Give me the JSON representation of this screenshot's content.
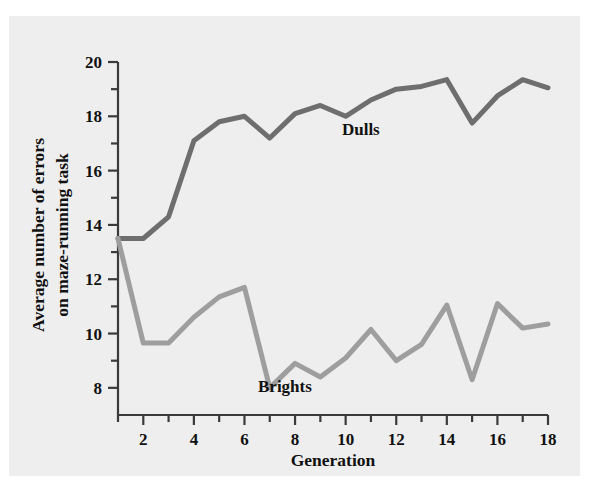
{
  "figure": {
    "background_color": "#eeeeee",
    "page_color": "#ffffff"
  },
  "chart_data": {
    "type": "line",
    "title": "",
    "xlabel": "Generation",
    "ylabel_line1": "Average number of errors",
    "ylabel_line2": "on maze-running task",
    "xlim": [
      1,
      18
    ],
    "ylim": [
      7,
      20
    ],
    "y_axis_visible_min": 7.0,
    "grid": false,
    "legend": "inline-annotations",
    "x_major_ticks": [
      2,
      4,
      6,
      8,
      10,
      12,
      14,
      16,
      18
    ],
    "x_minor_ticks": [
      1,
      3,
      5,
      7,
      9,
      11,
      13,
      15,
      17
    ],
    "x_tick_labels": [
      "2",
      "4",
      "6",
      "8",
      "10",
      "12",
      "14",
      "16",
      "18"
    ],
    "y_major_ticks": [
      8,
      10,
      12,
      14,
      16,
      18,
      20
    ],
    "y_minor_ticks": [
      9,
      11,
      13,
      15,
      17,
      19
    ],
    "y_tick_labels": [
      "8",
      "10",
      "12",
      "14",
      "16",
      "18",
      "20"
    ],
    "x": [
      1,
      2,
      3,
      4,
      5,
      6,
      7,
      8,
      9,
      10,
      11,
      12,
      13,
      14,
      15,
      16,
      17,
      18
    ],
    "series": [
      {
        "name": "Dulls",
        "color": "#6e6e6e",
        "label_x": 10.6,
        "label_y": 17.3,
        "values": [
          13.5,
          13.5,
          14.3,
          17.1,
          17.8,
          18.0,
          17.2,
          18.1,
          18.4,
          18.0,
          18.6,
          19.0,
          19.1,
          19.35,
          17.75,
          18.75,
          19.35,
          19.05
        ]
      },
      {
        "name": "Brights",
        "color": "#9e9e9e",
        "label_x": 7.6,
        "label_y": 7.85,
        "values": [
          13.5,
          9.65,
          9.65,
          10.6,
          11.35,
          11.7,
          8.0,
          8.9,
          8.4,
          9.1,
          10.15,
          9.0,
          9.6,
          11.05,
          8.3,
          11.1,
          10.2,
          10.35
        ]
      }
    ],
    "annotations": [
      {
        "text": "Dulls",
        "x": 10.6,
        "y": 17.3
      },
      {
        "text": "Brights",
        "x": 7.6,
        "y": 7.85
      }
    ]
  }
}
